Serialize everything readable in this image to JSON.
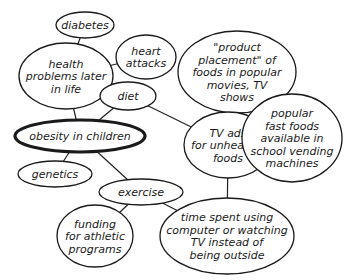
{
  "diagram": {
    "type": "concept-map",
    "caption_fragment": "",
    "nodes": [
      {
        "id": "diabetes",
        "lines": [
          "diabetes"
        ],
        "cx": 85,
        "cy": 25,
        "rx": 29,
        "ry": 13
      },
      {
        "id": "heart-attacks",
        "lines": [
          "heart",
          "attacks"
        ],
        "cx": 146,
        "cy": 57,
        "rx": 30,
        "ry": 22
      },
      {
        "id": "health-problems",
        "lines": [
          "health",
          "problems later",
          "in life"
        ],
        "cx": 66,
        "cy": 76,
        "rx": 47,
        "ry": 33
      },
      {
        "id": "diet",
        "lines": [
          "diet"
        ],
        "cx": 128,
        "cy": 96,
        "rx": 28,
        "ry": 14
      },
      {
        "id": "obesity-in-children",
        "lines": [
          "obesity in children"
        ],
        "cx": 80,
        "cy": 136,
        "rx": 65,
        "ry": 16,
        "central": true
      },
      {
        "id": "genetics",
        "lines": [
          "genetics"
        ],
        "cx": 55,
        "cy": 174,
        "rx": 37,
        "ry": 13
      },
      {
        "id": "exercise",
        "lines": [
          "exercise"
        ],
        "cx": 141,
        "cy": 192,
        "rx": 42,
        "ry": 13
      },
      {
        "id": "funding",
        "lines": [
          "funding",
          "for athletic",
          "programs"
        ],
        "cx": 95,
        "cy": 236,
        "rx": 38,
        "ry": 31
      },
      {
        "id": "product-placement",
        "lines": [
          "\"product",
          "placement\" of",
          "foods in popular",
          "movies, TV",
          "shows"
        ],
        "cx": 237,
        "cy": 72,
        "rx": 59,
        "ry": 41
      },
      {
        "id": "tv-ads",
        "lines": [
          "TV ads",
          "for unhealthy",
          "foods"
        ],
        "cx": 228,
        "cy": 145,
        "rx": 44,
        "ry": 33
      },
      {
        "id": "fast-foods",
        "lines": [
          "popular",
          "fast foods",
          "available in",
          "school vending",
          "machines"
        ],
        "cx": 292,
        "cy": 138,
        "rx": 50,
        "ry": 44
      },
      {
        "id": "time-spent",
        "lines": [
          "time spent using",
          "computer or watching",
          "TV instead of",
          "being outside"
        ],
        "cx": 227,
        "cy": 236,
        "rx": 67,
        "ry": 38
      }
    ],
    "edges": [
      {
        "from": "diabetes",
        "to": "health-problems",
        "x1": 76,
        "y1": 37,
        "x2": 71,
        "y2": 44
      },
      {
        "from": "heart-attacks",
        "to": "health-problems",
        "x1": 117,
        "y1": 60,
        "x2": 111,
        "y2": 63
      },
      {
        "from": "health-problems",
        "to": "obesity-in-children",
        "x1": 61,
        "y1": 108,
        "x2": 72,
        "y2": 121
      },
      {
        "from": "diet",
        "to": "obesity-in-children",
        "x1": 113,
        "y1": 108,
        "x2": 102,
        "y2": 121
      },
      {
        "from": "diet",
        "to": "tv-ads",
        "x1": 150,
        "y1": 104,
        "x2": 196,
        "y2": 124
      },
      {
        "from": "product-placement",
        "to": "tv-ads",
        "x1": 221,
        "y1": 112,
        "x2": 216,
        "y2": 114
      },
      {
        "from": "tv-ads",
        "to": "fast-foods",
        "x1": 272,
        "y1": 147,
        "x2": 242,
        "y2": 147
      },
      {
        "from": "tv-ads",
        "to": "time-spent",
        "x1": 225,
        "y1": 178,
        "x2": 226,
        "y2": 198
      },
      {
        "from": "obesity-in-children",
        "to": "genetics",
        "x1": 66,
        "y1": 151,
        "x2": 63,
        "y2": 162
      },
      {
        "from": "obesity-in-children",
        "to": "exercise",
        "x1": 122,
        "y1": 148,
        "x2": 135,
        "y2": 179
      },
      {
        "from": "exercise",
        "to": "funding",
        "x1": 125,
        "y1": 204,
        "x2": 111,
        "y2": 217
      },
      {
        "from": "exercise",
        "to": "time-spent",
        "x1": 176,
        "y1": 199,
        "x2": 176,
        "y2": 212
      }
    ]
  }
}
